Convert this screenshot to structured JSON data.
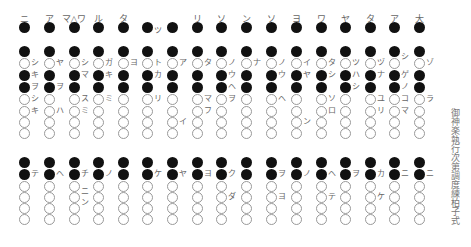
{
  "title": "御神楽執行次第調度練柏子式",
  "layout": {
    "columns_x": [
      24,
      49,
      74,
      98,
      123,
      147,
      172,
      197,
      221,
      246,
      271,
      296,
      321,
      345,
      370,
      394,
      419
    ],
    "upper_top_y": 27,
    "upper_rows_y": [
      51,
      63,
      75,
      87,
      99,
      111,
      122,
      133
    ],
    "lower_rows_y": [
      162,
      174,
      186,
      197,
      208,
      219
    ]
  },
  "upper": {
    "headers": [
      "ニ",
      "ア",
      "マ△ワ",
      "ル",
      "タ",
      "",
      "",
      "リ",
      "ソ",
      "ン",
      "ソ",
      "ヨ",
      "ワ",
      "ヤ",
      "タ",
      "ア",
      "大"
    ],
    "top_row": "ffffffffffffffffff",
    "pattern": [
      "f",
      "o",
      "f",
      "f",
      "o",
      "o",
      "o",
      "o"
    ],
    "labels": [
      {
        "col": 0,
        "row": 1,
        "text": "シ"
      },
      {
        "col": 0,
        "row": 2,
        "text": "キ"
      },
      {
        "col": 0,
        "row": 3,
        "text": "ヲ"
      },
      {
        "col": 0,
        "row": 4,
        "text": "シ"
      },
      {
        "col": 0,
        "row": 5,
        "text": "キ"
      },
      {
        "col": 1,
        "row": 1,
        "text": "ヤ"
      },
      {
        "col": 1,
        "row": 3,
        "text": "ヲ"
      },
      {
        "col": 1,
        "row": 5,
        "text": "ハ"
      },
      {
        "col": 2,
        "row": 1,
        "text": "シ"
      },
      {
        "col": 2,
        "row": 2,
        "text": "マ"
      },
      {
        "col": 2,
        "row": 4,
        "text": "ス"
      },
      {
        "col": 2,
        "row": 5,
        "text": "ミ"
      },
      {
        "col": 3,
        "row": 1,
        "text": "ガ"
      },
      {
        "col": 3,
        "row": 2,
        "text": "キ"
      },
      {
        "col": 3,
        "row": 4,
        "text": "ミ"
      },
      {
        "col": 4,
        "row": 1,
        "text": "ヨ"
      },
      {
        "col": 5,
        "row": -1,
        "text": "ツ"
      },
      {
        "col": 5,
        "row": 1,
        "text": "ト"
      },
      {
        "col": 5,
        "row": 2,
        "text": "カ"
      },
      {
        "col": 5,
        "row": 4,
        "text": "リ"
      },
      {
        "col": 6,
        "row": 1,
        "text": "ア"
      },
      {
        "col": 6,
        "row": 6,
        "text": "イ"
      },
      {
        "col": 7,
        "row": 1,
        "text": "タ"
      },
      {
        "col": 7,
        "row": 4,
        "text": "マ"
      },
      {
        "col": 7,
        "row": 5,
        "text": "フ"
      },
      {
        "col": 8,
        "row": 1,
        "text": "ノ"
      },
      {
        "col": 8,
        "row": 2,
        "text": "ウ"
      },
      {
        "col": 8,
        "row": 3,
        "text": "ヘ"
      },
      {
        "col": 8,
        "row": 4,
        "text": "ヲ"
      },
      {
        "col": 9,
        "row": 1,
        "text": "ナ"
      },
      {
        "col": 10,
        "row": 1,
        "text": "ノ"
      },
      {
        "col": 10,
        "row": 2,
        "text": "ウ"
      },
      {
        "col": 10,
        "row": 4,
        "text": "ヘ"
      },
      {
        "col": 11,
        "row": 1,
        "text": "イ"
      },
      {
        "col": 11,
        "row": 2,
        "text": "ヤ"
      },
      {
        "col": 11,
        "row": 6,
        "text": "ン"
      },
      {
        "col": 12,
        "row": 1,
        "text": "タ"
      },
      {
        "col": 12,
        "row": 2,
        "text": "シ"
      },
      {
        "col": 12,
        "row": 4,
        "text": "ソ"
      },
      {
        "col": 12,
        "row": 5,
        "text": "ロ"
      },
      {
        "col": 13,
        "row": 1,
        "text": "ツ"
      },
      {
        "col": 13,
        "row": 2,
        "text": "ハ"
      },
      {
        "col": 13,
        "row": 3,
        "text": "シ"
      },
      {
        "col": 14,
        "row": 1,
        "text": "ヅ"
      },
      {
        "col": 14,
        "row": 2,
        "text": "ナ"
      },
      {
        "col": 14,
        "row": 4,
        "text": "ユ"
      },
      {
        "col": 14,
        "row": 5,
        "text": "リ"
      },
      {
        "col": 15,
        "row": 0.5,
        "text": "シ"
      },
      {
        "col": 15,
        "row": 2,
        "text": "ゲ"
      },
      {
        "col": 15,
        "row": 3,
        "text": "ノ"
      },
      {
        "col": 15,
        "row": 4,
        "text": "コ"
      },
      {
        "col": 15,
        "row": 5,
        "text": "マ"
      },
      {
        "col": 16,
        "row": 1,
        "text": "ゾ"
      },
      {
        "col": 16,
        "row": 4,
        "text": "ラ"
      }
    ]
  },
  "lower": {
    "pattern": [
      "f",
      "f",
      "o",
      "o",
      "o",
      "o"
    ],
    "labels": [
      {
        "col": 0,
        "row": 1,
        "text": "テ"
      },
      {
        "col": 1,
        "row": 1,
        "text": "ヘ"
      },
      {
        "col": 2,
        "row": 1,
        "text": "チ"
      },
      {
        "col": 2,
        "row": 2.5,
        "text": "ニ"
      },
      {
        "col": 2,
        "row": 3.5,
        "text": "ン"
      },
      {
        "col": 3,
        "row": 1,
        "text": "ノ"
      },
      {
        "col": 5,
        "row": 1,
        "text": "ケ"
      },
      {
        "col": 6,
        "row": 1,
        "text": "ヤ"
      },
      {
        "col": 7,
        "row": 1,
        "text": "ヨ"
      },
      {
        "col": 8,
        "row": 1,
        "text": "ク"
      },
      {
        "col": 8,
        "row": 3,
        "text": "ダ"
      },
      {
        "col": 10,
        "row": 1,
        "text": "ヲ"
      },
      {
        "col": 10,
        "row": 3,
        "text": "ヨ"
      },
      {
        "col": 11,
        "row": 1,
        "text": "ノ"
      },
      {
        "col": 12,
        "row": 1,
        "text": "ヘ"
      },
      {
        "col": 12,
        "row": 3,
        "text": "テ"
      },
      {
        "col": 13,
        "row": 1,
        "text": "ヲ"
      },
      {
        "col": 14,
        "row": 1,
        "text": "カ"
      },
      {
        "col": 14,
        "row": 3,
        "text": "ケ"
      },
      {
        "col": 15,
        "row": 1,
        "text": "ニ"
      },
      {
        "col": 16,
        "row": 1,
        "text": "ニ"
      }
    ]
  }
}
